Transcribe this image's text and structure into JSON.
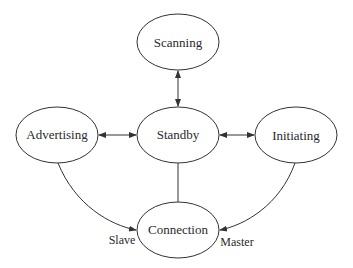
{
  "diagram": {
    "type": "state-diagram",
    "stroke_color": "#333333",
    "background_color": "#ffffff",
    "nodes": [
      {
        "id": "scanning",
        "label": "Scanning",
        "cx": 178,
        "cy": 42,
        "rx": 41,
        "ry": 28
      },
      {
        "id": "advertising",
        "label": "Advertising",
        "cx": 57,
        "cy": 135,
        "rx": 41,
        "ry": 28
      },
      {
        "id": "standby",
        "label": "Standby",
        "cx": 178,
        "cy": 135,
        "rx": 41,
        "ry": 28
      },
      {
        "id": "initiating",
        "label": "Initiating",
        "cx": 296,
        "cy": 135,
        "rx": 41,
        "ry": 28
      },
      {
        "id": "connection",
        "label": "Connection",
        "cx": 178,
        "cy": 230,
        "rx": 41,
        "ry": 28
      }
    ],
    "edges": [
      {
        "from": "standby",
        "to": "scanning",
        "bidirectional": true
      },
      {
        "from": "advertising",
        "to": "standby",
        "bidirectional": true
      },
      {
        "from": "standby",
        "to": "initiating",
        "bidirectional": true
      },
      {
        "from": "standby",
        "to": "connection",
        "bidirectional": false,
        "arrow": "none"
      },
      {
        "from": "advertising",
        "to": "connection",
        "bidirectional": false,
        "label": "Slave"
      },
      {
        "from": "initiating",
        "to": "connection",
        "bidirectional": false,
        "label": "Master"
      }
    ],
    "edge_labels": {
      "slave": "Slave",
      "master": "Master"
    }
  }
}
